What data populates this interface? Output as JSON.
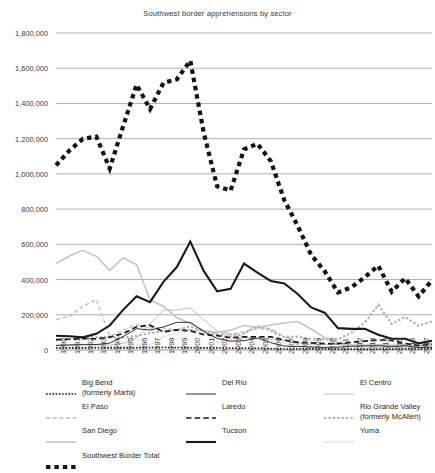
{
  "chart_data": {
    "type": "line",
    "title": "Southwest border apprehensions by sector",
    "xlabel": "",
    "ylabel": "",
    "ylim": [
      0,
      1800000
    ],
    "ytick_step": 200000,
    "grid": true,
    "legend_position": "bottom",
    "ytick_labels": [
      "1,800,000",
      "1,600,000",
      "1,400,000",
      "1,200,000",
      "1,000,000",
      "800,000",
      "600,000",
      "400,000",
      "200,000",
      "0"
    ],
    "ytick_values": [
      1800000,
      1600000,
      1400000,
      1200000,
      1000000,
      800000,
      600000,
      400000,
      200000,
      0
    ],
    "categories": [
      1990,
      1991,
      1992,
      1993,
      1994,
      1995,
      1996,
      1997,
      1998,
      1999,
      2000,
      2001,
      2002,
      2003,
      2004,
      2005,
      2006,
      2007,
      2008,
      2009,
      2010,
      2011,
      2012,
      2013,
      2014,
      2015,
      2016,
      2017,
      2018
    ],
    "series": [
      {
        "name": "Big Bend (formerly Marfa)",
        "key": "big-bend",
        "style": "dotted",
        "color": "#1a1a1a",
        "width": 1.6,
        "values": [
          11000,
          12000,
          12000,
          13000,
          12000,
          12000,
          13000,
          14000,
          14000,
          14000,
          13000,
          12000,
          12000,
          10000,
          10000,
          10000,
          7500,
          5500,
          5400,
          6400,
          5300,
          4000,
          3960,
          3680,
          4100,
          5000,
          6200,
          6000,
          8000
        ]
      },
      {
        "name": "Del Rio",
        "key": "del-rio",
        "style": "solid",
        "color": "#1a1a1a",
        "width": 0.9,
        "values": [
          26000,
          29000,
          30000,
          31000,
          39000,
          76000,
          121000,
          113000,
          131000,
          157000,
          157000,
          105000,
          66000,
          50000,
          53000,
          68000,
          42000,
          22000,
          20000,
          17000,
          15000,
          16000,
          21000,
          24000,
          24000,
          20000,
          24000,
          13000,
          16000
        ]
      },
      {
        "name": "El Centro",
        "key": "el-centro",
        "style": "solid",
        "color": "#b8b8b8",
        "width": 0.9,
        "values": [
          27000,
          25000,
          31000,
          30000,
          28000,
          37000,
          67000,
          147000,
          227000,
          226000,
          239000,
          172000,
          109000,
          92000,
          75000,
          64000,
          61000,
          56000,
          40000,
          33000,
          32000,
          30000,
          23000,
          17000,
          16000,
          16000,
          19000,
          18000,
          30000
        ]
      },
      {
        "name": "El Paso",
        "key": "el-paso",
        "style": "dashed",
        "color": "#bdbdbd",
        "width": 1.3,
        "values": [
          173000,
          192000,
          248000,
          286000,
          79000,
          110000,
          145000,
          125000,
          126000,
          111000,
          116000,
          112000,
          94000,
          88000,
          104000,
          122000,
          122000,
          75000,
          30000,
          15000,
          12000,
          10000,
          9700,
          11000,
          12000,
          14000,
          25000,
          25000,
          31000
        ]
      },
      {
        "name": "Laredo",
        "key": "laredo",
        "style": "dashed",
        "color": "#1a1a1a",
        "width": 1.7,
        "values": [
          59000,
          61000,
          65000,
          63000,
          73000,
          93000,
          132000,
          141000,
          103000,
          114000,
          109000,
          87000,
          82000,
          70000,
          74000,
          75000,
          75000,
          56000,
          43000,
          41000,
          36000,
          36000,
          44000,
          50000,
          57000,
          54000,
          37000,
          25000,
          32000
        ]
      },
      {
        "name": "Rio Grande Valley (formerly McAllen)",
        "key": "rio-grande-valley",
        "style": "dotted",
        "color": "#b0b0b0",
        "width": 2.2,
        "values": [
          56000,
          61000,
          70000,
          72000,
          74000,
          70000,
          80000,
          96000,
          108000,
          113000,
          134000,
          108000,
          89000,
          77000,
          93000,
          134000,
          110000,
          74000,
          76000,
          61000,
          60000,
          60000,
          98000,
          155000,
          257000,
          148000,
          187000,
          138000,
          162000
        ]
      },
      {
        "name": "San Diego",
        "key": "san-diego",
        "style": "solid",
        "color": "#c4c4c4",
        "width": 1.6,
        "values": [
          491000,
          534000,
          566000,
          532000,
          451000,
          524000,
          484000,
          284000,
          249000,
          183000,
          152000,
          111000,
          101000,
          112000,
          139000,
          126000,
          142000,
          153000,
          162000,
          119000,
          69000,
          42000,
          29000,
          27000,
          29000,
          26000,
          31000,
          26000,
          38000
        ]
      },
      {
        "name": "Tucson",
        "key": "tucson",
        "style": "solid",
        "color": "#1a1a1a",
        "width": 2.1,
        "values": [
          81000,
          78000,
          72000,
          92000,
          139000,
          228000,
          305000,
          272000,
          387000,
          471000,
          616000,
          449000,
          333000,
          347000,
          491000,
          439000,
          392000,
          378000,
          318000,
          242000,
          212000,
          124000,
          120000,
          121000,
          87000,
          64000,
          64000,
          38000,
          52000
        ]
      },
      {
        "name": "Yuma",
        "key": "yuma",
        "style": "dotted",
        "color": "#d0d0d0",
        "width": 1.6,
        "values": [
          15000,
          14000,
          13000,
          23000,
          21000,
          21000,
          28000,
          30000,
          76000,
          93000,
          108000,
          108000,
          42000,
          56000,
          98000,
          138000,
          118000,
          37000,
          8400,
          6900,
          7100,
          5800,
          6500,
          6100,
          5900,
          7100,
          14000,
          12000,
          26000
        ]
      },
      {
        "name": "Southwest Border Total",
        "key": "southwest-border-total",
        "style": "dotted",
        "color": "#141414",
        "width": 4.2,
        "values": [
          1049000,
          1133000,
          1199000,
          1212000,
          1031000,
          1271000,
          1507000,
          1368000,
          1517000,
          1537000,
          1643000,
          1235000,
          929000,
          905000,
          1139000,
          1171000,
          1072000,
          851000,
          705000,
          540000,
          448000,
          327000,
          356000,
          414000,
          479000,
          331000,
          408000,
          304000,
          396000
        ]
      }
    ]
  },
  "legend": {
    "columns": [
      {
        "items": [
          {
            "label": "Big Bend",
            "sub": "(formerly Marfa)",
            "key": "big-bend"
          },
          {
            "label": "El Paso",
            "sub": "",
            "key": "el-paso"
          },
          {
            "label": "San Diego",
            "sub": "",
            "key": "san-diego"
          }
        ]
      },
      {
        "items": [
          {
            "label": "Del Rio",
            "sub": "",
            "key": "del-rio"
          },
          {
            "label": "Laredo",
            "sub": "",
            "key": "laredo"
          },
          {
            "label": "Tucson",
            "sub": "",
            "key": "tucson"
          }
        ]
      },
      {
        "items": [
          {
            "label": "El Centro",
            "sub": "",
            "key": "el-centro"
          },
          {
            "label": "Rio Grande Valley",
            "sub": "(formerly McAllen)",
            "key": "rio-grande-valley"
          },
          {
            "label": "Yuma",
            "sub": "",
            "key": "yuma"
          }
        ]
      }
    ],
    "total": {
      "label": "Southwest Border Total",
      "sub": "",
      "key": "southwest-border-total"
    }
  }
}
